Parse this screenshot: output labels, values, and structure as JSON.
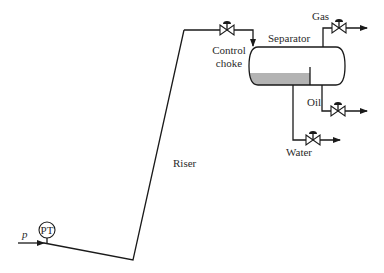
{
  "diagram": {
    "title": "",
    "labels": {
      "pressure_symbol": "p",
      "pressure_transmitter": "PT",
      "riser": "Riser",
      "control_choke_line1": "Control",
      "control_choke_line2": "choke",
      "separator": "Separator",
      "gas": "Gas",
      "oil": "Oil",
      "water": "Water"
    },
    "components": [
      {
        "id": "pressure-transmitter",
        "type": "instrument",
        "label": "PT"
      },
      {
        "id": "flowline",
        "type": "pipe"
      },
      {
        "id": "riser",
        "type": "pipe",
        "label": "Riser"
      },
      {
        "id": "control-choke",
        "type": "valve",
        "label": "Control choke"
      },
      {
        "id": "separator",
        "type": "vessel",
        "label": "Separator"
      },
      {
        "id": "gas-valve",
        "type": "valve",
        "outlet": "Gas"
      },
      {
        "id": "oil-valve",
        "type": "valve",
        "outlet": "Oil"
      },
      {
        "id": "water-valve",
        "type": "valve",
        "outlet": "Water"
      }
    ],
    "colors": {
      "line": "#1a1a1a",
      "liquid": "#b3b3b3",
      "background": "#ffffff"
    }
  }
}
